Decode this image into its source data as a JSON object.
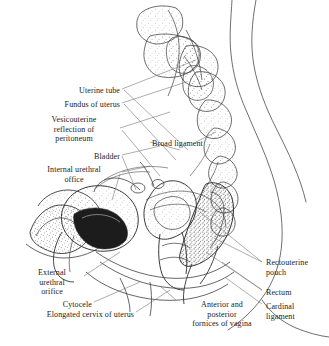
{
  "figure": {
    "background_color": "#ffffff",
    "ink_color": "#1a1a1a",
    "line_color": "#555555",
    "footer_note": ""
  },
  "labels": {
    "left": [
      {
        "id": "uterine-tube",
        "text": "Uterine tube",
        "x": 28,
        "y": 86,
        "align": "right",
        "width": 92
      },
      {
        "id": "fundus-of-uterus",
        "text": "Fundus of uterus",
        "x": 18,
        "y": 100,
        "align": "right",
        "width": 102
      },
      {
        "id": "vesicouterine-reflection",
        "text": "Vesicouterine\nreflection of\nperitoneum",
        "x": 30,
        "y": 115,
        "align": "center",
        "width": 88
      },
      {
        "id": "bladder",
        "text": "Bladder",
        "x": 40,
        "y": 152,
        "align": "right",
        "width": 80
      },
      {
        "id": "internal-urethral-office",
        "text": "Internal urethral\noffice",
        "x": 28,
        "y": 165,
        "align": "center",
        "width": 92
      },
      {
        "id": "external-urethral-orifice",
        "text": "External\nurethral\norifice",
        "x": 22,
        "y": 268,
        "align": "center",
        "width": 60
      },
      {
        "id": "cytocele",
        "text": "Cytocele",
        "x": 30,
        "y": 300,
        "align": "right",
        "width": 62
      },
      {
        "id": "elongated-cervix-of-uterus",
        "text": "Elongated cervix of uterus",
        "x": 2,
        "y": 310,
        "align": "right",
        "width": 132
      }
    ],
    "center": [
      {
        "id": "broad-ligament",
        "text": "Broad ligament",
        "x": 152,
        "y": 139,
        "align": "left",
        "width": 80
      },
      {
        "id": "anterior-posterior-fornices",
        "text": "Anterior and\nposterior\nfornices of vagina",
        "x": 178,
        "y": 300,
        "align": "center",
        "width": 88
      }
    ],
    "right": [
      {
        "id": "rectouterine-pouch",
        "text": "Rectouterine\npouch",
        "x": 266,
        "y": 258,
        "align": "left",
        "width": 60
      },
      {
        "id": "rectum",
        "text": "Rectum",
        "x": 266,
        "y": 288,
        "align": "left",
        "width": 60
      },
      {
        "id": "cardinal-ligament",
        "text": "Cardinal\nligament",
        "x": 266,
        "y": 302,
        "align": "left",
        "width": 60
      }
    ]
  },
  "structures": [
    {
      "id": "sacrum-vertebrae",
      "name": "Sacrum and coccyx vertebrae"
    },
    {
      "id": "pubic-symphysis",
      "name": "Pubic symphysis"
    },
    {
      "id": "bladder-body",
      "name": "Urinary bladder"
    },
    {
      "id": "uterus-body",
      "name": "Uterus"
    },
    {
      "id": "vagina-canal",
      "name": "Vagina"
    },
    {
      "id": "rectum-body",
      "name": "Rectum"
    },
    {
      "id": "body-outline",
      "name": "Abdominal and gluteal body contour"
    }
  ]
}
